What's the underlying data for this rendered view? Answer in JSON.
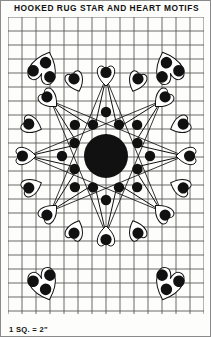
{
  "page": {
    "title": "HOOKED RUG STAR AND HEART MOTIFS",
    "scale_note": "1 SQ. = 2\"",
    "ink_color": "#111111",
    "paper_color": "#fdfdfb",
    "grid_color": "#5a5a5a",
    "border_color": "#8a8a8a"
  },
  "grid": {
    "origin_x": 7,
    "origin_y": 16,
    "cell_px": 14,
    "cols": 14,
    "rows": 21,
    "width_px": 196,
    "height_px": 297,
    "line_width": 0.9
  },
  "pattern": {
    "name": "star-and-heart-medallion",
    "center_x": 98,
    "center_y": 139,
    "center_circle": {
      "name": "center-disc",
      "radius": 22,
      "fill": "#111111"
    },
    "inner_dot_ring": {
      "name": "inner-dot-ring",
      "count": 8,
      "radius": 34,
      "dot_radius": 5.2,
      "angle_offset_deg": 22.5
    },
    "mid_dot_ring": {
      "name": "mid-dot-ring",
      "count": 8,
      "radius": 44,
      "dot_radius": 5.2,
      "angle_offset_deg": 0
    },
    "star": {
      "name": "eight-point-star",
      "points": 8,
      "outer_radius": 78,
      "inner_radius": 30,
      "stroke": "#111111",
      "stroke_width": 1.0
    },
    "heart_ring": {
      "name": "heart-ring",
      "count": 16,
      "radius": 80,
      "heart_size": 21,
      "dot_radius": 5.6,
      "stroke_width": 1.0
    },
    "corner_hearts": [
      {
        "name": "corner-heart-top-left",
        "x": 36,
        "y": 50,
        "size": 33,
        "rotate": 200,
        "dots": 3
      },
      {
        "name": "corner-heart-top-right",
        "x": 160,
        "y": 50,
        "size": 33,
        "rotate": 160,
        "dots": 3
      },
      {
        "name": "corner-heart-bottom-left",
        "x": 36,
        "y": 268,
        "size": 33,
        "rotate": 340,
        "dots": 3
      },
      {
        "name": "corner-heart-bottom-right",
        "x": 160,
        "y": 268,
        "size": 33,
        "rotate": 20,
        "dots": 3
      }
    ]
  },
  "chart_data": {
    "type": "diagram",
    "title": "HOOKED RUG STAR AND HEART MOTIFS",
    "subtitle": "1 SQ. = 2\"",
    "grid": {
      "cols": 14,
      "rows": 21,
      "square_equals": "2 inches"
    },
    "motifs": [
      {
        "motif": "central-medallion",
        "count": 1,
        "description": "solid disc with 8-point star"
      },
      {
        "motif": "inner-dot-ring",
        "count": 8
      },
      {
        "motif": "mid-dot-ring",
        "count": 8
      },
      {
        "motif": "radial-hearts",
        "count": 16,
        "dots_each": 1
      },
      {
        "motif": "corner-hearts",
        "count": 4,
        "dots_each": 3
      }
    ]
  }
}
